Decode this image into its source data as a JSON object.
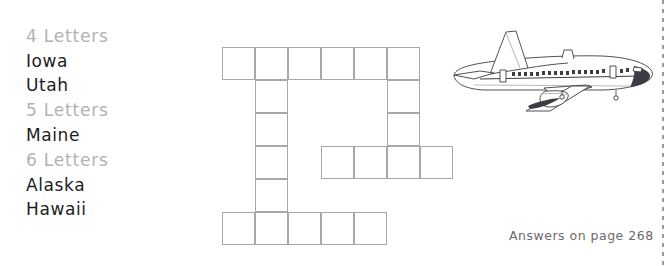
{
  "word_list": {
    "groups": [
      {
        "heading": "4 Letters",
        "words": [
          "Iowa",
          "Utah"
        ]
      },
      {
        "heading": "5 Letters",
        "words": [
          "Maine"
        ]
      },
      {
        "heading": "6 Letters",
        "words": [
          "Alaska",
          "Hawaii"
        ]
      }
    ]
  },
  "crossword": {
    "columns": 7,
    "rows": 6,
    "cell_size": 33,
    "cells": [
      {
        "col": 0,
        "row": 0
      },
      {
        "col": 1,
        "row": 0
      },
      {
        "col": 2,
        "row": 0
      },
      {
        "col": 3,
        "row": 0
      },
      {
        "col": 4,
        "row": 0
      },
      {
        "col": 5,
        "row": 0
      },
      {
        "col": 1,
        "row": 1
      },
      {
        "col": 5,
        "row": 1
      },
      {
        "col": 1,
        "row": 2
      },
      {
        "col": 5,
        "row": 2
      },
      {
        "col": 1,
        "row": 3
      },
      {
        "col": 3,
        "row": 3
      },
      {
        "col": 4,
        "row": 3
      },
      {
        "col": 5,
        "row": 3
      },
      {
        "col": 6,
        "row": 3
      },
      {
        "col": 1,
        "row": 4
      },
      {
        "col": 0,
        "row": 5
      },
      {
        "col": 1,
        "row": 5
      },
      {
        "col": 2,
        "row": 5
      },
      {
        "col": 3,
        "row": 5
      },
      {
        "col": 4,
        "row": 5
      }
    ]
  },
  "illustration": {
    "name": "airliner-side-view",
    "alt": "Commercial jet airliner shown from the side"
  },
  "answers_note": {
    "text": "Answers on page 268"
  },
  "colors": {
    "heading_gray": "#b2b2b2",
    "word_black": "#1d1d1d",
    "grid_line": "#a8a8ac",
    "note_gray": "#6b6b6b",
    "cut_line": "#9a9a9a",
    "page_background": "#ffffff"
  }
}
